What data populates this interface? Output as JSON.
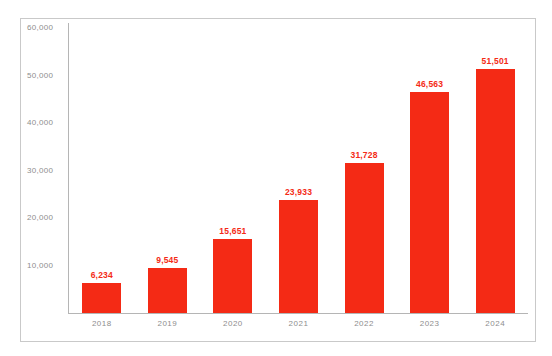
{
  "chart_data": {
    "type": "bar",
    "title": "",
    "subtitle": "",
    "xlabel": "",
    "ylabel": "",
    "categories": [
      "2018",
      "2019",
      "2020",
      "2021",
      "2022",
      "2023",
      "2024"
    ],
    "values": [
      6234,
      9545,
      15651,
      23933,
      31728,
      46563,
      51501
    ],
    "value_labels": [
      "6,234",
      "9,545",
      "15,651",
      "23,933",
      "31,728",
      "46,563",
      "51,501"
    ],
    "series": [
      {
        "name": "",
        "values": [
          6234,
          9545,
          15651,
          23933,
          31728,
          46563,
          51501
        ],
        "color": "#F42A15"
      }
    ],
    "ylim": [
      0,
      62000
    ],
    "yticks": [
      10000,
      20000,
      30000,
      40000,
      50000,
      60000
    ],
    "ytick_labels": [
      "10,000",
      "20,000",
      "30,000",
      "40,000",
      "50,000",
      "60,000"
    ],
    "grid": false,
    "legend": false,
    "legend_position": "none",
    "colors": {
      "bar": "#F42A15",
      "value_label": "#F42A15",
      "axis_label": "#8e8e8e",
      "axis_line": "#b5b5b5",
      "frame_border": "#c9c9c9",
      "background": "#ffffff"
    }
  }
}
